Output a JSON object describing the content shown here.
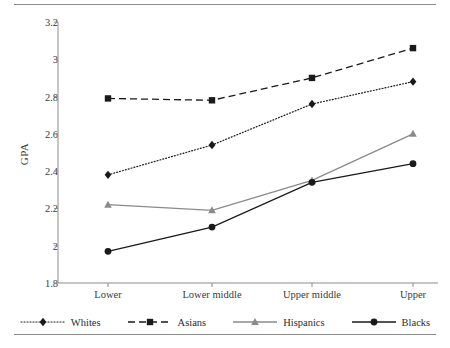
{
  "chart_data": {
    "type": "line",
    "title": "",
    "xlabel": "",
    "ylabel": "GPA",
    "categories": [
      "Lower",
      "Lower middle",
      "Upper middle",
      "Upper"
    ],
    "ylim": [
      1.8,
      3.2
    ],
    "yticks": [
      "1.8",
      "2",
      "2.2",
      "2.4",
      "2.6",
      "2.8",
      "3",
      "3.2"
    ],
    "ytick_values": [
      1.8,
      2.0,
      2.2,
      2.4,
      2.6,
      2.8,
      3.0,
      3.2
    ],
    "grid": false,
    "legend_position": "bottom",
    "series": [
      {
        "name": "Whites",
        "values": [
          2.38,
          2.54,
          2.76,
          2.88
        ],
        "color": "#1a1a1a",
        "line_style": "dotted",
        "marker": "diamond"
      },
      {
        "name": "Asians",
        "values": [
          2.79,
          2.78,
          2.9,
          3.06
        ],
        "color": "#1a1a1a",
        "line_style": "dashed",
        "marker": "square"
      },
      {
        "name": "Hispanics",
        "values": [
          2.22,
          2.19,
          2.35,
          2.6
        ],
        "color": "#8a8a8a",
        "line_style": "solid",
        "marker": "triangle"
      },
      {
        "name": "Blacks",
        "values": [
          1.97,
          2.1,
          2.34,
          2.44
        ],
        "color": "#1a1a1a",
        "line_style": "solid",
        "marker": "circle"
      }
    ]
  },
  "axis": {
    "color": "#8d8d8d"
  },
  "rules": {
    "top": true,
    "bottom": true
  }
}
